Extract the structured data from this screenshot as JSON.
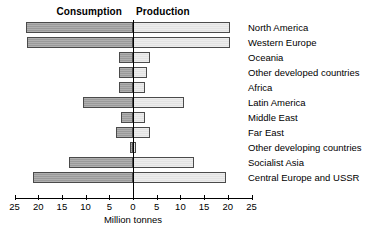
{
  "chart_data": {
    "type": "bar",
    "orientation": "horizontal-diverging",
    "title": "",
    "xlabel": "Million tonnes",
    "ylabel": "",
    "xlim": [
      -25,
      25
    ],
    "xticks": [
      -25,
      -20,
      -15,
      -10,
      -5,
      0,
      5,
      10,
      15,
      20,
      25
    ],
    "xticklabels": [
      "25",
      "20",
      "15",
      "10",
      "5",
      "0",
      "5",
      "10",
      "15",
      "20",
      "25"
    ],
    "grid": false,
    "legend": [
      "Consumption",
      "Production"
    ],
    "legend_position": "top",
    "categories": [
      "North America",
      "Western Europe",
      "Oceania",
      "Other developed countries",
      "Africa",
      "Latin America",
      "Middle East",
      "Far East",
      "Other developing countries",
      "Socialist Asia",
      "Central Europe and USSR"
    ],
    "series": [
      {
        "name": "Consumption",
        "side": "left",
        "color": "#9a9a9a",
        "values": [
          22.5,
          22.3,
          3.0,
          3.0,
          3.0,
          10.5,
          2.5,
          3.5,
          0.6,
          13.5,
          21.0
        ]
      },
      {
        "name": "Production",
        "side": "right",
        "color": "#e2e2e2",
        "values": [
          20.5,
          20.5,
          3.5,
          3.0,
          2.5,
          10.7,
          2.5,
          3.5,
          0.6,
          12.8,
          19.7
        ]
      }
    ]
  },
  "headers": {
    "consumption": "Consumption",
    "production": "Production"
  },
  "axis": {
    "title": "Million tonnes"
  }
}
